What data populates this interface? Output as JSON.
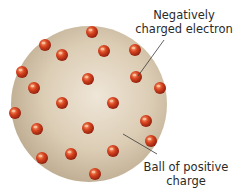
{
  "diagram": {
    "sphere": {
      "cx": 89,
      "cy": 104,
      "r": 78,
      "fill_light": "#ece2d2",
      "fill_mid": "#d8c9b0",
      "fill_dark": "#b8a68a"
    },
    "electrons": {
      "color_light": "#f28a5a",
      "color_mid": "#d2401f",
      "color_dark": "#8e1e0c",
      "r": 6,
      "points": [
        [
          92,
          32
        ],
        [
          45,
          45
        ],
        [
          62,
          55
        ],
        [
          104,
          51
        ],
        [
          135,
          50
        ],
        [
          22,
          72
        ],
        [
          88,
          79
        ],
        [
          136,
          77
        ],
        [
          160,
          88
        ],
        [
          34,
          88
        ],
        [
          62,
          103
        ],
        [
          113,
          103
        ],
        [
          15,
          113
        ],
        [
          146,
          121
        ],
        [
          37,
          129
        ],
        [
          88,
          128
        ],
        [
          151,
          141
        ],
        [
          71,
          154
        ],
        [
          113,
          151
        ],
        [
          42,
          158
        ],
        [
          95,
          174
        ]
      ]
    },
    "labels": {
      "electron_line1": "Negatively",
      "electron_line2": "charged electron",
      "ball_line1": "Ball of positive",
      "ball_line2": "charge"
    },
    "leaders": {
      "electron": {
        "x1": 138,
        "y1": 76,
        "x2": 164,
        "y2": 40
      },
      "ball": {
        "x1": 123,
        "y1": 134,
        "x2": 157,
        "y2": 154
      }
    }
  }
}
